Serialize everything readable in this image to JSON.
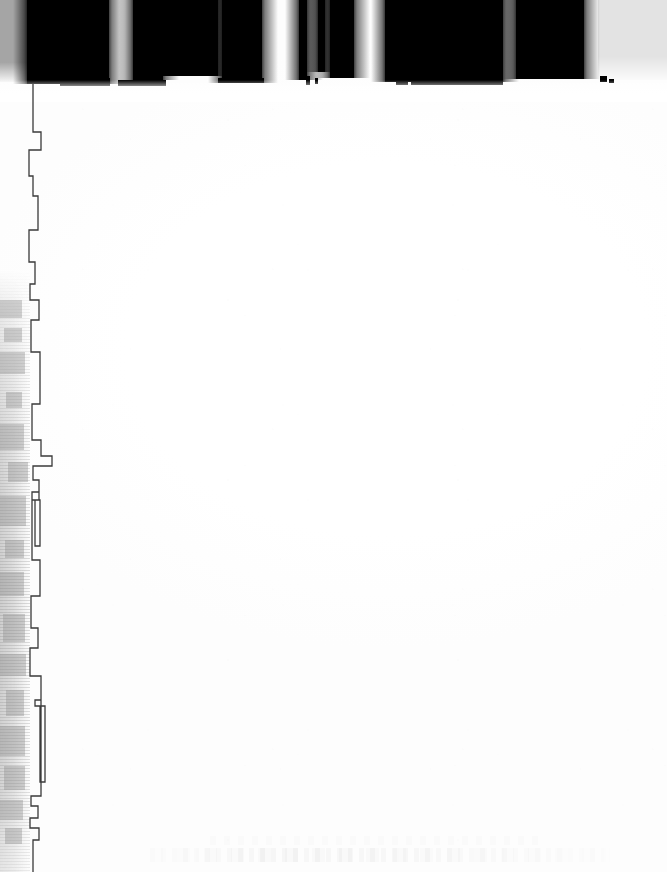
{
  "document": {
    "kind": "scanned-page",
    "condition": "overexposed",
    "page_width": 667,
    "page_height": 872,
    "body_text": "",
    "legible_text": "none",
    "notes": "Severely overexposed scan; page body is blank white with no legible characters."
  },
  "colors": {
    "page_background": "#ffffff",
    "ink_black": "#000000",
    "panel_gray_right": "#e3e3e3",
    "panel_gray_left": "#a5a5a5",
    "contour_stroke": "#3a3a3a",
    "spine_gray": "#8c8c8c"
  },
  "regions": {
    "top_band": {
      "name": "top-dark-band",
      "y": 0,
      "height": 90,
      "description": "Row of large blown-out black shapes"
    },
    "gray_panel_left": {
      "name": "left-gray-panel",
      "x": 0,
      "y": 0,
      "width": 27,
      "height": 82
    },
    "gray_panel_right": {
      "name": "right-gray-panel",
      "x": 598,
      "y": 0,
      "width": 69,
      "height": 80
    },
    "page_body": {
      "name": "blank-page-body",
      "x": 60,
      "y": 95,
      "width": 607,
      "height": 777
    },
    "left_spine": {
      "name": "left-spine-shadow",
      "x": 0,
      "y": 270,
      "width": 30,
      "height": 602
    },
    "bottom_ghost": {
      "name": "bottom-ghost-text",
      "x": 150,
      "y": 836,
      "width": 460,
      "height": 26
    }
  },
  "top_blobs": [
    {
      "x": 27,
      "y": 0,
      "width": 82,
      "height": 84
    },
    {
      "x": 133,
      "y": 0,
      "width": 30,
      "height": 80
    },
    {
      "x": 163,
      "y": 0,
      "width": 55,
      "height": 76
    },
    {
      "x": 222,
      "y": 0,
      "width": 40,
      "height": 83
    },
    {
      "x": 299,
      "y": 0,
      "width": 8,
      "height": 80
    },
    {
      "x": 318,
      "y": 0,
      "width": 7,
      "height": 72
    },
    {
      "x": 330,
      "y": 0,
      "width": 24,
      "height": 78
    },
    {
      "x": 385,
      "y": 0,
      "width": 118,
      "height": 82
    },
    {
      "x": 516,
      "y": 0,
      "width": 68,
      "height": 79
    }
  ],
  "top_specks": [
    {
      "x": 60,
      "y": 78,
      "width": 50,
      "height": 8
    },
    {
      "x": 118,
      "y": 80,
      "width": 48,
      "height": 6
    },
    {
      "x": 218,
      "y": 78,
      "width": 46,
      "height": 5
    },
    {
      "x": 306,
      "y": 76,
      "width": 4,
      "height": 9
    },
    {
      "x": 315,
      "y": 78,
      "width": 3,
      "height": 6
    },
    {
      "x": 396,
      "y": 74,
      "width": 12,
      "height": 11
    },
    {
      "x": 411,
      "y": 79,
      "width": 22,
      "height": 6
    },
    {
      "x": 433,
      "y": 81,
      "width": 70,
      "height": 4
    },
    {
      "x": 600,
      "y": 76,
      "width": 7,
      "height": 6
    },
    {
      "x": 609,
      "y": 79,
      "width": 5,
      "height": 4
    }
  ],
  "spine_chunks": [
    {
      "x": 0,
      "y": 300,
      "width": 22,
      "height": 18
    },
    {
      "x": 4,
      "y": 328,
      "width": 18,
      "height": 14
    },
    {
      "x": 0,
      "y": 352,
      "width": 25,
      "height": 22
    },
    {
      "x": 6,
      "y": 392,
      "width": 16,
      "height": 16
    },
    {
      "x": 0,
      "y": 424,
      "width": 24,
      "height": 26
    },
    {
      "x": 8,
      "y": 462,
      "width": 20,
      "height": 20
    },
    {
      "x": 0,
      "y": 496,
      "width": 26,
      "height": 30
    },
    {
      "x": 5,
      "y": 540,
      "width": 19,
      "height": 18
    },
    {
      "x": 0,
      "y": 572,
      "width": 24,
      "height": 24
    },
    {
      "x": 3,
      "y": 614,
      "width": 22,
      "height": 28
    },
    {
      "x": 0,
      "y": 654,
      "width": 26,
      "height": 22
    },
    {
      "x": 6,
      "y": 690,
      "width": 18,
      "height": 26
    },
    {
      "x": 0,
      "y": 726,
      "width": 25,
      "height": 30
    },
    {
      "x": 4,
      "y": 766,
      "width": 21,
      "height": 24
    },
    {
      "x": 0,
      "y": 800,
      "width": 23,
      "height": 20
    },
    {
      "x": 5,
      "y": 828,
      "width": 17,
      "height": 16
    }
  ],
  "margin_contour": {
    "name": "left-margin-contour",
    "stroke_width": 1.3,
    "path": "M 33 84 L 33 132 L 41 132 L 41 150 L 29 150 L 29 176 L 33 176 L 33 196 L 38 196 L 38 230 L 29 230 L 29 262 L 35 262 L 35 284 L 30 284 L 30 300 L 39 300 L 39 320 L 31 320 L 31 352 L 40 352 L 40 404 L 32 404 L 32 440 L 41 440 L 41 456 L 52 456 L 52 466 L 33 466 L 33 480 L 39 480 L 39 492 L 32 492 L 32 500 L 40 500 L 40 546 L 35 546 L 35 500 L 39 500 L 39 492 L 32 492 L 32 560 L 40 560 L 40 596 L 31 596 L 31 628 L 38 628 L 38 648 L 30 648 L 30 676 L 41 676 L 41 700 L 35 700 L 35 706 L 45 706 L 45 782 L 40 782 L 40 706 L 35 706 L 35 700 L 41 700 L 41 796 L 31 796 L 31 806 L 38 806 L 38 818 L 30 818 L 30 828 L 39 828 L 39 840 L 33 840 L 33 872",
    "segments": [
      {
        "name": "seg-upper",
        "y_start": 84,
        "y_end": 300
      },
      {
        "name": "seg-middle",
        "y_start": 300,
        "y_end": 560
      },
      {
        "name": "seg-lower",
        "y_start": 560,
        "y_end": 872
      }
    ]
  }
}
